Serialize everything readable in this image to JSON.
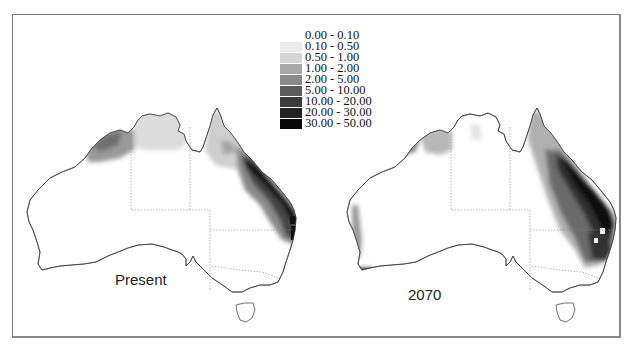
{
  "figure": {
    "type": "choropleth-map-pair",
    "region": "Australia",
    "panels": [
      {
        "label": "Present",
        "description": "Highest values along Queensland east coast (20-50 class), moderate values in Kimberley (2-10) and Cape York (1-5), light values across Top End (0.5-1)"
      },
      {
        "label": "2070",
        "description": "Expanded high values across eastern Queensland and northern NSW (10-50), spots in south-west WA coast, reduced Kimberley and Top End"
      }
    ]
  },
  "legend": {
    "items": [
      {
        "label": "0.00 - 0.10",
        "color": "#ffffff"
      },
      {
        "label": "0.10 - 0.50",
        "color": "#ececec"
      },
      {
        "label": "0.50 - 1.00",
        "color": "#d4d4d4"
      },
      {
        "label": "1.00 - 2.00",
        "color": "#a8a8a8"
      },
      {
        "label": "2.00 - 5.00",
        "color": "#8a8a8a"
      },
      {
        "label": "5.00 - 10.00",
        "color": "#5c5c5c"
      },
      {
        "label": "10.00 - 20.00",
        "color": "#3a3a3a"
      },
      {
        "label": "20.00 - 30.00",
        "color": "#222222"
      },
      {
        "label": "30.00 - 50.00",
        "color": "#080808"
      }
    ]
  }
}
